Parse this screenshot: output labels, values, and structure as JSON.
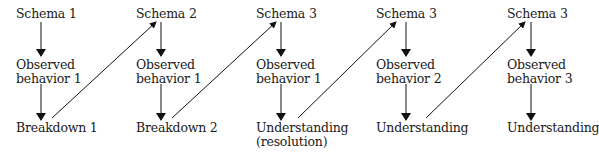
{
  "diagram": {
    "columns": [
      {
        "schema": "Schema  1",
        "observed_line1": "Observed",
        "observed_line2": "behavior  1",
        "outcome_line1": "Breakdown  1",
        "outcome_line2": ""
      },
      {
        "schema": "Schema  2",
        "observed_line1": "Observed",
        "observed_line2": "behavior  1",
        "outcome_line1": "Breakdown  2",
        "outcome_line2": ""
      },
      {
        "schema": "Schema  3",
        "observed_line1": "Observed",
        "observed_line2": "behavior  1",
        "outcome_line1": "Understanding",
        "outcome_line2": "(resolution)"
      },
      {
        "schema": "Schema  3",
        "observed_line1": "Observed",
        "observed_line2": "behavior  2",
        "outcome_line1": "Understanding",
        "outcome_line2": ""
      },
      {
        "schema": "Schema  3",
        "observed_line1": "Observed",
        "observed_line2": "behavior  3",
        "outcome_line1": "Understanding",
        "outcome_line2": ""
      }
    ],
    "edges": [
      {
        "from": "schema-1",
        "to": "observed-1",
        "type": "vertical"
      },
      {
        "from": "observed-1",
        "to": "outcome-1",
        "type": "vertical"
      },
      {
        "from": "outcome-1",
        "to": "schema-2",
        "type": "diagonal"
      },
      {
        "from": "schema-2",
        "to": "observed-2",
        "type": "vertical"
      },
      {
        "from": "observed-2",
        "to": "outcome-2",
        "type": "vertical"
      },
      {
        "from": "outcome-2",
        "to": "schema-3",
        "type": "diagonal"
      },
      {
        "from": "schema-3",
        "to": "observed-3",
        "type": "vertical"
      },
      {
        "from": "observed-3",
        "to": "outcome-3",
        "type": "vertical"
      },
      {
        "from": "outcome-3",
        "to": "schema-4",
        "type": "diagonal"
      },
      {
        "from": "schema-4",
        "to": "observed-4",
        "type": "vertical"
      },
      {
        "from": "observed-4",
        "to": "outcome-4",
        "type": "vertical"
      },
      {
        "from": "outcome-4",
        "to": "schema-5",
        "type": "diagonal"
      },
      {
        "from": "schema-5",
        "to": "observed-5",
        "type": "vertical"
      },
      {
        "from": "observed-5",
        "to": "outcome-5",
        "type": "vertical"
      }
    ]
  }
}
